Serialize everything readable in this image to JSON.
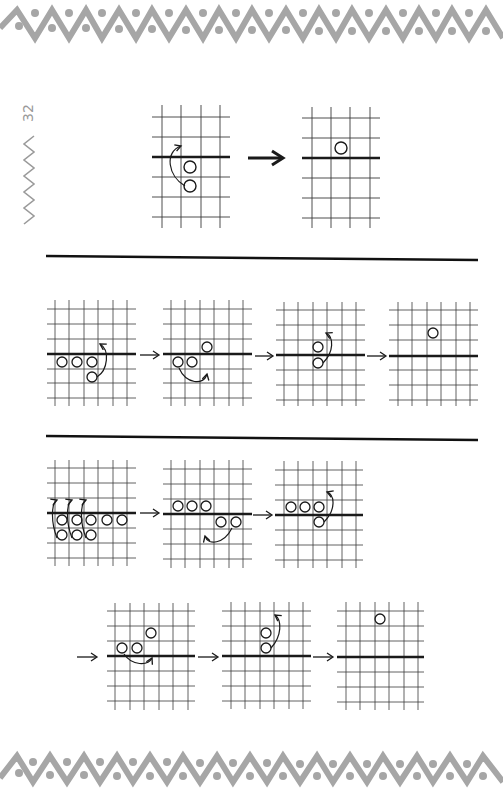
{
  "page": {
    "number": "32",
    "border_color": "#a6a6a6",
    "ink_color": "#1a1a1a"
  },
  "sections": [
    {
      "id": "section-1",
      "steps": [
        {
          "grid": {
            "x": 153,
            "y": 105,
            "cols": 4,
            "rows": 6,
            "cell": 19.5
          },
          "line_row": 3,
          "chips": [
            [
              2,
              3
            ],
            [
              2,
              4
            ]
          ],
          "move": "up-left arc from (2,4) to above line at col 1"
        },
        {
          "grid": {
            "x": 303,
            "y": 105,
            "cols": 4,
            "rows": 6,
            "cell": 19.5
          },
          "line_row": 3,
          "chips": [
            [
              1,
              2
            ]
          ]
        }
      ]
    },
    {
      "id": "section-2",
      "steps": [
        {
          "grid": {
            "x": 47,
            "y": 300,
            "cols": 6,
            "rows": 7,
            "cell": 14.5
          },
          "line_row": 4,
          "chips": [
            [
              0,
              4
            ],
            [
              1,
              4
            ],
            [
              2,
              4
            ],
            [
              2,
              5
            ]
          ]
        },
        {
          "grid": {
            "x": 163,
            "y": 300,
            "cols": 6,
            "rows": 7,
            "cell": 14.5
          },
          "line_row": 4,
          "chips": [
            [
              0,
              4
            ],
            [
              1,
              4
            ],
            [
              2,
              3
            ]
          ]
        },
        {
          "grid": {
            "x": 276,
            "y": 300,
            "cols": 6,
            "rows": 7,
            "cell": 14.5
          },
          "line_row": 4,
          "chips": [
            [
              2,
              3
            ],
            [
              2,
              4
            ]
          ]
        },
        {
          "grid": {
            "x": 390,
            "y": 300,
            "cols": 6,
            "rows": 7,
            "cell": 14.5
          },
          "line_row": 4,
          "chips": [
            [
              2,
              2
            ]
          ]
        }
      ]
    },
    {
      "id": "section-3",
      "steps": [
        {
          "grid": {
            "x": 47,
            "y": 460,
            "cols": 6,
            "rows": 7,
            "cell": 14.5
          },
          "line_row": 4,
          "chips": [
            [
              0,
              4
            ],
            [
              1,
              4
            ],
            [
              2,
              4
            ],
            [
              3,
              4
            ],
            [
              4,
              4
            ],
            [
              0,
              5
            ],
            [
              1,
              5
            ],
            [
              2,
              5
            ]
          ]
        },
        {
          "grid": {
            "x": 163,
            "y": 460,
            "cols": 6,
            "rows": 7,
            "cell": 14.5
          },
          "line_row": 4,
          "chips": [
            [
              0,
              3
            ],
            [
              1,
              3
            ],
            [
              2,
              3
            ],
            [
              3,
              4
            ],
            [
              4,
              4
            ]
          ]
        },
        {
          "grid": {
            "x": 276,
            "y": 460,
            "cols": 6,
            "rows": 7,
            "cell": 14.5
          },
          "line_row": 4,
          "chips": [
            [
              0,
              3
            ],
            [
              1,
              3
            ],
            [
              2,
              3
            ],
            [
              2,
              4
            ]
          ]
        },
        {
          "grid": {
            "x": 108,
            "y": 603,
            "cols": 6,
            "rows": 7,
            "cell": 14.5
          },
          "line_row": 4,
          "chips": [
            [
              0,
              3
            ],
            [
              1,
              3
            ],
            [
              2,
              2
            ]
          ]
        },
        {
          "grid": {
            "x": 223,
            "y": 603,
            "cols": 6,
            "rows": 7,
            "cell": 14.5
          },
          "line_row": 4,
          "chips": [
            [
              2,
              2
            ],
            [
              2,
              3
            ]
          ]
        },
        {
          "grid": {
            "x": 337,
            "y": 603,
            "cols": 6,
            "rows": 7,
            "cell": 14.5
          },
          "line_row": 4,
          "chips": [
            [
              2,
              1
            ]
          ]
        }
      ]
    }
  ],
  "dividers": [
    {
      "y": 258
    },
    {
      "y": 437
    }
  ]
}
